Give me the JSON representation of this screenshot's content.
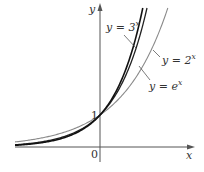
{
  "chart_data": {
    "type": "line",
    "title": "",
    "xlabel": "x",
    "ylabel": "y",
    "origin_label": "0",
    "y_tick_labels": [
      "1"
    ],
    "y_ticks": [
      1
    ],
    "grid": false,
    "legend": "inline annotations with leader lines",
    "xlim": [
      -2.7,
      2.9
    ],
    "ylim": [
      -0.5,
      4.5
    ],
    "series": [
      {
        "name": "y = 3^x",
        "base": 3,
        "function": "3^x",
        "label_prefix": "y = 3",
        "label_exp": "x",
        "color": "#111111",
        "width": 1.6
      },
      {
        "name": "y = e^x",
        "base": 2.718281828,
        "function": "e^x",
        "label_prefix": "y = e",
        "label_exp": "x",
        "color": "#222222",
        "width": 1.3
      },
      {
        "name": "y = 2^x",
        "base": 2,
        "function": "2^x",
        "label_prefix": "y = 2",
        "label_exp": "x",
        "color": "#8a8a8a",
        "width": 1.1
      }
    ],
    "annotations": [
      {
        "text": "y = 3^x",
        "points_to": "3^x curve"
      },
      {
        "text": "y = 2^x",
        "points_to": "2^x curve"
      },
      {
        "text": "y = e^x",
        "points_to": "e^x curve"
      }
    ],
    "intersection": {
      "x": 0,
      "y": 1,
      "label": "1"
    }
  },
  "colors": {
    "axis": "#555555",
    "text": "#333333",
    "background": "#ffffff"
  }
}
